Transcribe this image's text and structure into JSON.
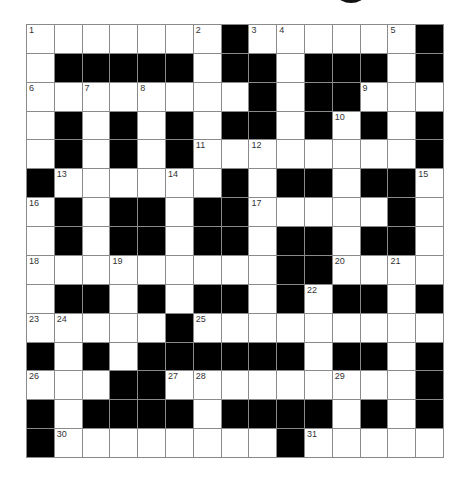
{
  "puzzle": {
    "type": "crossword",
    "size": {
      "rows": 15,
      "cols": 15
    },
    "colors": {
      "black": "#000000",
      "white": "#ffffff",
      "grid_line": "#8a8a8a",
      "number": "#333333"
    },
    "grid": [
      "WWWWWWWBWWWWWWB",
      "WBBBBBWBBWBBBWB",
      "WWWWWWWWBWBBWWW",
      "WBWBWBWBBWBWBWB",
      "WBWBWBWWWWWWWWB",
      "BWWWWWWBWBBWBBW",
      "WBWBBWBBWWWWWBW",
      "WBWBBWBBWBBWBBW",
      "WWWWWWWWWBBWWWW",
      "WBBWBWBBWBWBBWB",
      "WWWWWBWWWWWWWWW",
      "BWBWBBBBBBWBBWB",
      "WWWBBWWWWWWWWWB",
      "BWBBBBWBBBBWBWB",
      "BWWWWWWWWBWWWWW"
    ],
    "numbers": [
      {
        "row": 0,
        "col": 0,
        "n": "1"
      },
      {
        "row": 0,
        "col": 6,
        "n": "2"
      },
      {
        "row": 0,
        "col": 8,
        "n": "3"
      },
      {
        "row": 0,
        "col": 9,
        "n": "4"
      },
      {
        "row": 0,
        "col": 13,
        "n": "5"
      },
      {
        "row": 2,
        "col": 0,
        "n": "6"
      },
      {
        "row": 2,
        "col": 2,
        "n": "7"
      },
      {
        "row": 2,
        "col": 4,
        "n": "8"
      },
      {
        "row": 2,
        "col": 12,
        "n": "9"
      },
      {
        "row": 3,
        "col": 11,
        "n": "10"
      },
      {
        "row": 4,
        "col": 6,
        "n": "11"
      },
      {
        "row": 4,
        "col": 8,
        "n": "12"
      },
      {
        "row": 5,
        "col": 1,
        "n": "13"
      },
      {
        "row": 5,
        "col": 5,
        "n": "14"
      },
      {
        "row": 5,
        "col": 14,
        "n": "15"
      },
      {
        "row": 6,
        "col": 0,
        "n": "16"
      },
      {
        "row": 6,
        "col": 8,
        "n": "17"
      },
      {
        "row": 8,
        "col": 0,
        "n": "18"
      },
      {
        "row": 8,
        "col": 3,
        "n": "19"
      },
      {
        "row": 8,
        "col": 11,
        "n": "20"
      },
      {
        "row": 8,
        "col": 13,
        "n": "21"
      },
      {
        "row": 9,
        "col": 10,
        "n": "22"
      },
      {
        "row": 10,
        "col": 0,
        "n": "23"
      },
      {
        "row": 10,
        "col": 1,
        "n": "24"
      },
      {
        "row": 10,
        "col": 6,
        "n": "25"
      },
      {
        "row": 12,
        "col": 0,
        "n": "26"
      },
      {
        "row": 12,
        "col": 5,
        "n": "27"
      },
      {
        "row": 12,
        "col": 6,
        "n": "28"
      },
      {
        "row": 12,
        "col": 11,
        "n": "29"
      },
      {
        "row": 14,
        "col": 1,
        "n": "30"
      },
      {
        "row": 14,
        "col": 10,
        "n": "31"
      }
    ]
  }
}
